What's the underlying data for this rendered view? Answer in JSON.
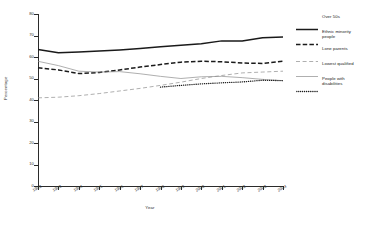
{
  "axes": {
    "ylabel": "Percentage",
    "xlabel": "Year",
    "yticks": [
      "0",
      "10",
      "20",
      "30",
      "40",
      "50",
      "60",
      "70",
      "80"
    ],
    "xticks": [
      "1992",
      "1993",
      "1994",
      "1995",
      "1996",
      "1997",
      "1998",
      "1999",
      "2000",
      "2001",
      "2002",
      "2003",
      "2004"
    ]
  },
  "legend": {
    "items": [
      {
        "label": "Over 50s",
        "style": "thick-solid",
        "color": "#1a1a1a"
      },
      {
        "label": "Ethnic minority\npeople",
        "style": "thick-dashed",
        "color": "#1a1a1a"
      },
      {
        "label": "Lone parents",
        "style": "thin-dashed",
        "color": "#8c8c8c"
      },
      {
        "label": "Lowest qualified",
        "style": "thin-solid",
        "color": "#8c8c8c"
      },
      {
        "label": "People with\ndisabilities",
        "style": "dotted",
        "color": "#1a1a1a"
      }
    ]
  },
  "chart_data": {
    "type": "line",
    "title": "",
    "xlabel": "Year",
    "ylabel": "Percentage",
    "ylim": [
      0,
      80
    ],
    "grid": false,
    "legend_position": "right",
    "x": [
      1992,
      1993,
      1994,
      1995,
      1996,
      1997,
      1998,
      1999,
      2000,
      2001,
      2002,
      2003,
      2004
    ],
    "categories": [
      "1992",
      "1993",
      "1994",
      "1995",
      "1996",
      "1997",
      "1998",
      "1999",
      "2000",
      "2001",
      "2002",
      "2003",
      "2004"
    ],
    "series": [
      {
        "name": "Over 50s",
        "color": "#1a1a1a",
        "style": "thick-solid",
        "values": [
          63.5,
          62.0,
          62.3,
          62.8,
          63.3,
          64.0,
          64.8,
          65.5,
          66.2,
          67.5,
          67.4,
          69.0,
          69.3
        ]
      },
      {
        "name": "Ethnic minority people",
        "color": "#1a1a1a",
        "style": "thick-dashed",
        "values": [
          55.0,
          54.0,
          52.3,
          52.8,
          54.0,
          55.3,
          56.5,
          57.6,
          58.0,
          57.8,
          57.2,
          57.0,
          58.0
        ]
      },
      {
        "name": "Lone parents",
        "color": "#8c8c8c",
        "style": "thin-dashed",
        "values": [
          41.0,
          41.3,
          42.0,
          43.0,
          44.2,
          45.4,
          46.8,
          48.3,
          50.0,
          51.4,
          52.6,
          53.0,
          53.4
        ]
      },
      {
        "name": "Lowest qualified",
        "color": "#8c8c8c",
        "style": "thin-solid",
        "values": [
          58.0,
          56.0,
          53.4,
          53.0,
          53.2,
          52.2,
          51.0,
          50.0,
          50.8,
          51.0,
          50.4,
          49.6,
          49.0
        ]
      },
      {
        "name": "People with disabilities",
        "color": "#1a1a1a",
        "style": "dotted",
        "values": [
          null,
          null,
          null,
          null,
          null,
          null,
          46.0,
          46.8,
          47.5,
          48.0,
          48.4,
          49.2,
          49.0
        ]
      }
    ]
  }
}
